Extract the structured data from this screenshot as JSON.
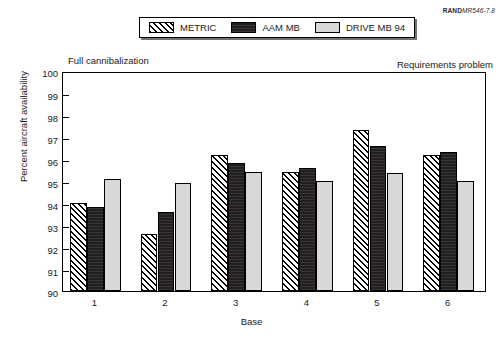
{
  "source_id": {
    "prefix": "RAND",
    "number": "MR546-7.8"
  },
  "legend": {
    "items": [
      {
        "label": "METRIC",
        "key": "metric",
        "color": "#ffffff"
      },
      {
        "label": "AAM MB",
        "key": "aam",
        "color": "#231f20"
      },
      {
        "label": "DRIVE MB 94",
        "key": "drive",
        "color": "#d8d8d8"
      }
    ]
  },
  "annotations": {
    "left": "Full cannibalization",
    "right": "Requirements problem"
  },
  "chart_data": {
    "type": "bar",
    "title": "",
    "xlabel": "Base",
    "ylabel": "Percent aircraft availability",
    "categories": [
      "1",
      "2",
      "3",
      "4",
      "5",
      "6"
    ],
    "ylim": [
      90,
      100
    ],
    "yticks": [
      90,
      91,
      92,
      93,
      94,
      95,
      96,
      97,
      98,
      99,
      100
    ],
    "grid": false,
    "legend_position": "top-center",
    "series": [
      {
        "name": "METRIC",
        "values": [
          94.0,
          92.6,
          96.2,
          95.4,
          97.3,
          96.2
        ]
      },
      {
        "name": "AAM MB",
        "values": [
          93.8,
          93.6,
          95.8,
          95.6,
          96.6,
          96.3
        ]
      },
      {
        "name": "DRIVE MB 94",
        "values": [
          95.1,
          94.9,
          95.4,
          95.0,
          95.35,
          95.0
        ]
      }
    ]
  }
}
